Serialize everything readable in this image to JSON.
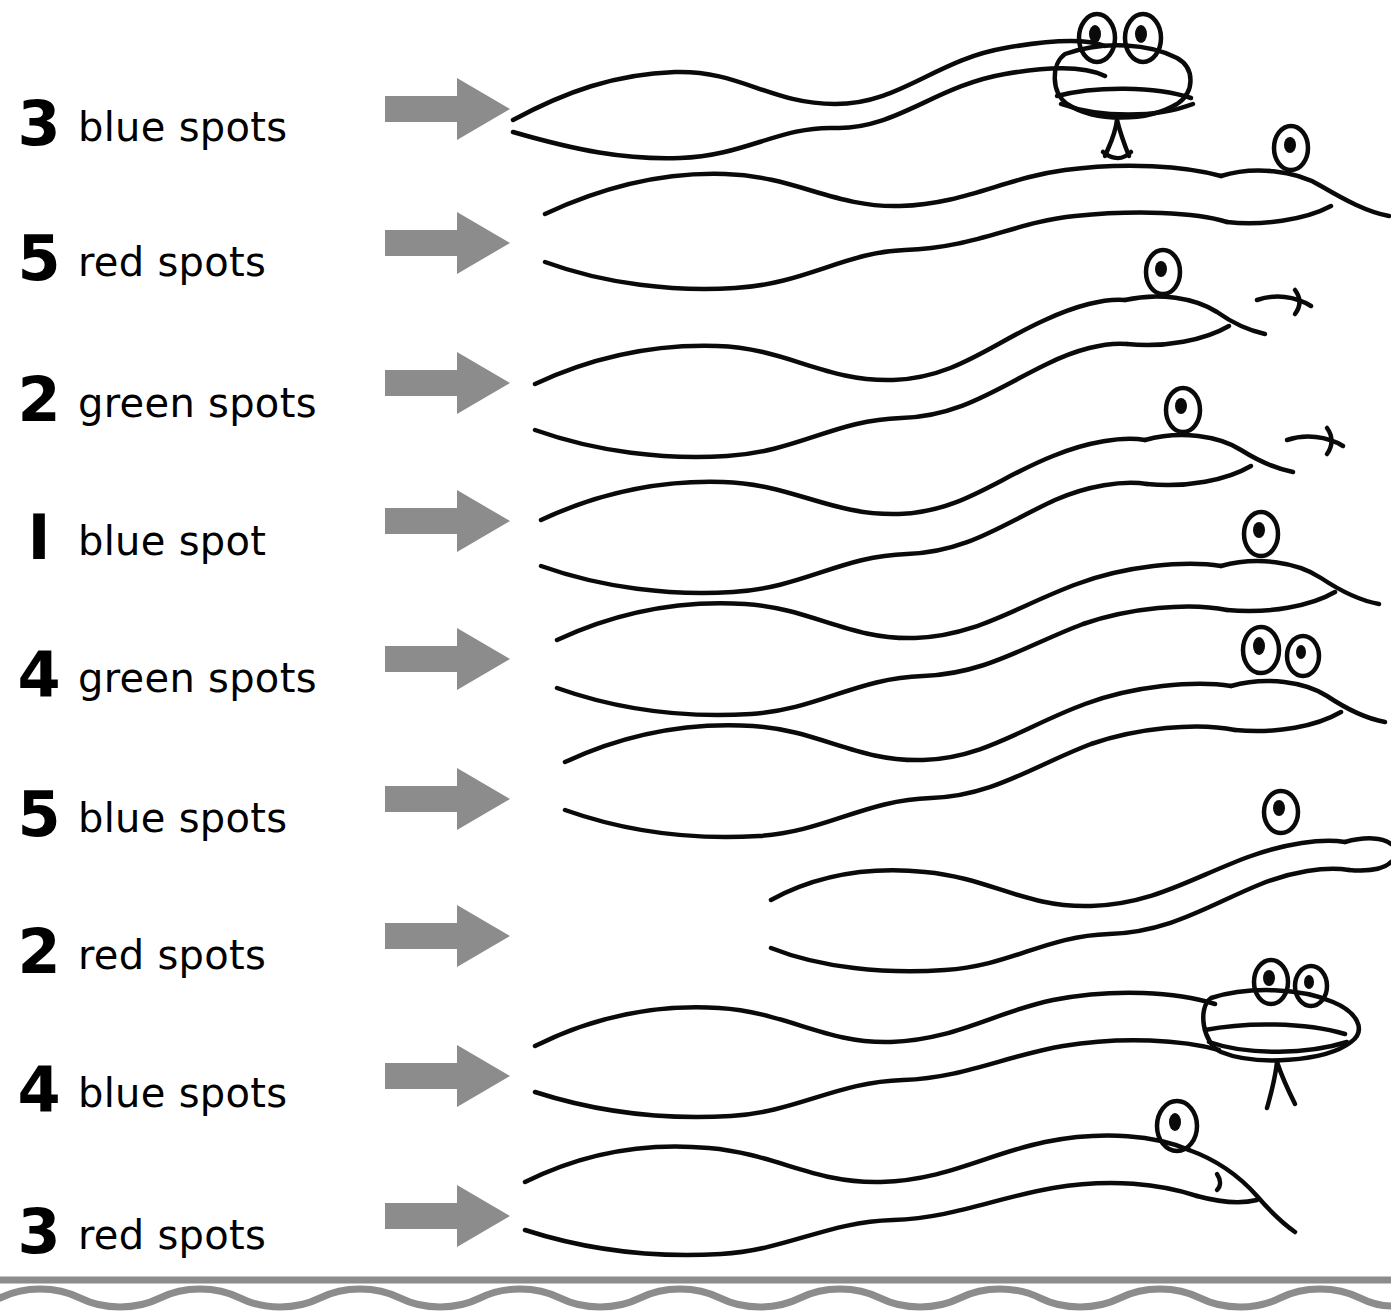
{
  "worksheet": {
    "title": "Snake spot colouring instructions",
    "arrow_icon": "right-arrow-icon",
    "snake_icon": "snake-drawing",
    "border_icon": "wavy-line-divider",
    "rows": [
      {
        "number": "3",
        "label": "blue spots",
        "color": "#2a4fb5",
        "count": 3
      },
      {
        "number": "5",
        "label": "red spots",
        "color": "#cf2027",
        "count": 5
      },
      {
        "number": "2",
        "label": "green spots",
        "color": "#1f8a3c",
        "count": 2
      },
      {
        "number": "I",
        "label": "blue spot",
        "color": "#2a4fb5",
        "count": 1
      },
      {
        "number": "4",
        "label": "green spots",
        "color": "#1f8a3c",
        "count": 4
      },
      {
        "number": "5",
        "label": "blue spots",
        "color": "#2a4fb5",
        "count": 5
      },
      {
        "number": "2",
        "label": "red spots",
        "color": "#cf2027",
        "count": 2
      },
      {
        "number": "4",
        "label": "blue spots",
        "color": "#2a4fb5",
        "count": 4
      },
      {
        "number": "3",
        "label": "red spots",
        "color": "#cf2027",
        "count": 3
      }
    ]
  },
  "style": {
    "arrow_fill": "#8c8c8c",
    "ink": "#0a0a0a",
    "paper": "#ffffff"
  }
}
